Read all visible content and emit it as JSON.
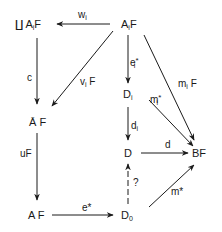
{
  "diagram": {
    "type": "commutative-diagram",
    "nodes": {
      "coprod_AiF": {
        "prefix": "∐",
        "base": "A",
        "sub": "i",
        "suffix": "F"
      },
      "AiF": {
        "base": "A",
        "sub": "i",
        "suffix": "F"
      },
      "AbarF": {
        "base": "Ā",
        "suffix": " F"
      },
      "AF": {
        "text": "A F"
      },
      "Di": {
        "base": "D",
        "sub": "i"
      },
      "D": {
        "text": "D"
      },
      "BF": {
        "text": "BF"
      },
      "D0": {
        "base": "D",
        "sub": "0"
      }
    },
    "arrows": {
      "wi": {
        "base": "w",
        "sub": "i",
        "from": "AiF",
        "to": "coprod_AiF"
      },
      "c": {
        "text": "c",
        "from": "coprod_AiF",
        "to": "AbarF"
      },
      "viF": {
        "base": "v",
        "sub": "i",
        "suffix": " F",
        "from": "AiF",
        "to": "AbarF"
      },
      "uF": {
        "text": "uF",
        "from": "AbarF",
        "to": "AF"
      },
      "ei_star": {
        "base": "e",
        "sub": "i",
        "sup": "*",
        "from": "AiF",
        "to": "Di"
      },
      "miF": {
        "base": "m",
        "sub": "i",
        "suffix": " F",
        "from": "AiF",
        "to": "BF"
      },
      "mi_star": {
        "base": "m",
        "sub": "i",
        "sup": "*",
        "from": "Di",
        "to": "BF"
      },
      "di": {
        "base": "d",
        "sub": "i",
        "from": "Di",
        "to": "D"
      },
      "d": {
        "text": "d",
        "from": "D",
        "to": "BF"
      },
      "question": {
        "text": "?",
        "from": "D0",
        "to": "D",
        "style": "dashed"
      },
      "m_star": {
        "text": "m*",
        "from": "D0",
        "to": "BF"
      },
      "e_star": {
        "text": "e*",
        "from": "AF",
        "to": "D0"
      }
    }
  }
}
